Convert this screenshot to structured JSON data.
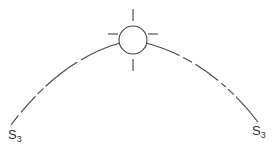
{
  "diagram": {
    "type": "sun-path-arc",
    "stroke_color": "#444444",
    "background": "#ffffff",
    "sun": {
      "cx": 133,
      "cy": 40,
      "r": 14
    },
    "labels": {
      "left": {
        "base": "S",
        "sub": "3"
      },
      "right": {
        "base": "S",
        "sub": "3"
      }
    }
  }
}
